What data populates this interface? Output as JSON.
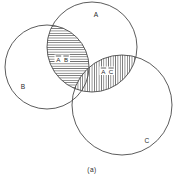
{
  "figure": {
    "caption": "(a)",
    "background_color": "#ffffff",
    "stroke_color": "#4a4a4a",
    "text_color": "#2b2b2b"
  },
  "sets": [
    {
      "id": "A",
      "label": "A",
      "label_x": 96,
      "label_y": 17,
      "cx": 92,
      "cy": 47,
      "r": 45
    },
    {
      "id": "B",
      "label": "B",
      "label_x": 23,
      "label_y": 89,
      "cx": 47,
      "cy": 67,
      "r": 42
    },
    {
      "id": "C",
      "label": "C",
      "label_x": 147,
      "label_y": 143,
      "cx": 122,
      "cy": 105,
      "r": 50
    }
  ],
  "regions": [
    {
      "id": "AB",
      "label_part_1": "A",
      "label_part_2": "B",
      "overbar": true,
      "hatch": "horizontal",
      "label_x": 62,
      "label_y": 61,
      "sets": [
        "A",
        "B"
      ]
    },
    {
      "id": "AC",
      "label_part_1": "A",
      "label_part_2": "C",
      "overbar": true,
      "hatch": "vertical",
      "label_x": 107,
      "label_y": 73,
      "sets": [
        "A",
        "C"
      ]
    }
  ]
}
